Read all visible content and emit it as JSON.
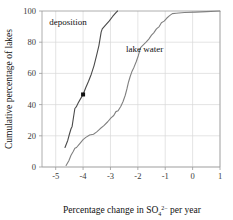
{
  "chart_data": {
    "type": "line",
    "title": "",
    "xlabel": "Percentage change in SO₄²⁻ per year",
    "ylabel": "Cumulative percentage of lakes",
    "xlim": [
      -5.5,
      1
    ],
    "ylim": [
      0,
      100
    ],
    "grid": true,
    "legend_position": "inline-annotation",
    "xticks": [
      -5,
      -4,
      -3,
      -2,
      -1,
      0,
      1
    ],
    "xtick_labels": [
      "-5",
      "-4",
      "-3",
      "-2",
      "-1",
      "0",
      "1"
    ],
    "yticks": [
      0,
      20,
      40,
      60,
      80,
      100
    ],
    "ytick_labels": [
      "0",
      "20",
      "40",
      "60",
      "80",
      "100"
    ],
    "series": [
      {
        "name": "deposition",
        "label_x": -4.55,
        "label_y": 91,
        "color": "#4a4a4a",
        "points": [
          [
            -4.66,
            12.5
          ],
          [
            -4.56,
            17.0
          ],
          [
            -4.5,
            21.0
          ],
          [
            -4.44,
            24.5
          ],
          [
            -4.4,
            26.0
          ],
          [
            -4.34,
            33.0
          ],
          [
            -4.3,
            37.5
          ],
          [
            -4.25,
            38.5
          ],
          [
            -4.18,
            41.0
          ],
          [
            -4.1,
            43.5
          ],
          [
            -4.0,
            46.5
          ],
          [
            -3.9,
            51.0
          ],
          [
            -3.8,
            55.0
          ],
          [
            -3.7,
            59.5
          ],
          [
            -3.6,
            65.0
          ],
          [
            -3.5,
            72.0
          ],
          [
            -3.42,
            78.0
          ],
          [
            -3.34,
            86.5
          ],
          [
            -3.3,
            88.5
          ],
          [
            -3.18,
            91.0
          ],
          [
            -3.05,
            93.5
          ],
          [
            -2.92,
            96.5
          ],
          [
            -2.8,
            99.0
          ],
          [
            -2.74,
            100
          ]
        ]
      },
      {
        "name": "lake water",
        "label_x": -1.75,
        "label_y": 74,
        "color": "#808080",
        "points": [
          [
            -4.62,
            1.0
          ],
          [
            -4.52,
            4.0
          ],
          [
            -4.44,
            7.5
          ],
          [
            -4.36,
            10.0
          ],
          [
            -4.3,
            12.0
          ],
          [
            -4.24,
            12.5
          ],
          [
            -4.12,
            15.0
          ],
          [
            -4.0,
            17.5
          ],
          [
            -3.9,
            19.0
          ],
          [
            -3.76,
            20.5
          ],
          [
            -3.62,
            21.0
          ],
          [
            -3.5,
            22.5
          ],
          [
            -3.38,
            24.5
          ],
          [
            -3.24,
            26.5
          ],
          [
            -3.1,
            29.0
          ],
          [
            -2.98,
            31.5
          ],
          [
            -2.88,
            33.0
          ],
          [
            -2.8,
            35.5
          ],
          [
            -2.72,
            36.0
          ],
          [
            -2.62,
            39.0
          ],
          [
            -2.54,
            42.0
          ],
          [
            -2.46,
            46.0
          ],
          [
            -2.4,
            50.0
          ],
          [
            -2.34,
            54.5
          ],
          [
            -2.28,
            58.0
          ],
          [
            -2.22,
            61.0
          ],
          [
            -2.14,
            64.0
          ],
          [
            -2.06,
            67.5
          ],
          [
            -1.98,
            71.5
          ],
          [
            -1.9,
            76.5
          ],
          [
            -1.82,
            78.0
          ],
          [
            -1.7,
            80.0
          ],
          [
            -1.6,
            82.0
          ],
          [
            -1.5,
            84.5
          ],
          [
            -1.42,
            86.0
          ],
          [
            -1.32,
            88.5
          ],
          [
            -1.22,
            90.0
          ],
          [
            -1.14,
            92.5
          ],
          [
            -1.04,
            93.5
          ],
          [
            -0.94,
            95.5
          ],
          [
            -0.84,
            97.0
          ],
          [
            -0.74,
            98.3
          ],
          [
            -0.6,
            98.6
          ],
          [
            -0.3,
            99.0
          ],
          [
            0.1,
            99.3
          ],
          [
            0.5,
            99.6
          ],
          [
            1.0,
            100
          ]
        ]
      }
    ],
    "markers": [
      {
        "name": "deposition-highlight-point",
        "x": -4.0,
        "y": 46.5,
        "color": "#111111"
      }
    ]
  },
  "labels": {
    "deposition": "deposition",
    "lake_water": "lake water",
    "ylabel": "Cumulative percentage of lakes",
    "xlabel_pre": "Percentage change in SO",
    "xlabel_sub": "4",
    "xlabel_sup": "2−",
    "xlabel_post": " per year"
  },
  "colors": {
    "background": "#ffffff",
    "grid": "#d9d9d9",
    "axis": "#9a9a9a",
    "deposition": "#4a4a4a",
    "lake_water": "#808080",
    "text": "#1a1a1a"
  }
}
